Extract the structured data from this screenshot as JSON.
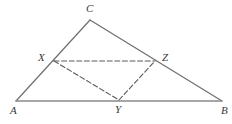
{
  "figure": {
    "type": "geometry-diagram",
    "background_color": "#ffffff",
    "width": 232,
    "height": 124
  },
  "style": {
    "solid_stroke_color": "#6e6e6e",
    "base_stroke_color": "#8a8a8a",
    "dashed_stroke_color": "#5a5a5a",
    "label_color": "#3a3a3a",
    "solid_stroke_width": "1.2",
    "base_stroke_width": "1.4",
    "dashed_stroke_width": "1.1",
    "dash_pattern": "5,2.6"
  },
  "points": {
    "A": {
      "label": "A",
      "x": 16,
      "y": 101,
      "label_x": 10,
      "label_y": 105
    },
    "B": {
      "label": "B",
      "x": 222,
      "y": 101,
      "label_x": 221,
      "label_y": 105
    },
    "C": {
      "label": "C",
      "x": 90,
      "y": 20,
      "label_x": 86,
      "label_y": 3
    },
    "X": {
      "label": "X",
      "x": 54,
      "y": 61,
      "label_x": 38,
      "label_y": 52
    },
    "Y": {
      "label": "Y",
      "x": 119,
      "y": 100,
      "label_x": 115,
      "label_y": 104
    },
    "Z": {
      "label": "Z",
      "x": 155,
      "y": 61,
      "label_x": 162,
      "label_y": 52
    }
  },
  "segments": {
    "solid": [
      {
        "name": "side-AC",
        "from": "A",
        "to": "C",
        "x1": 16,
        "y1": 101,
        "x2": 90,
        "y2": 20
      },
      {
        "name": "side-CB",
        "from": "C",
        "to": "B",
        "x1": 90,
        "y1": 20,
        "x2": 222,
        "y2": 101
      },
      {
        "name": "side-AB",
        "from": "A",
        "to": "B",
        "x1": 16,
        "y1": 101,
        "x2": 222,
        "y2": 101
      }
    ],
    "dashed": [
      {
        "name": "segment-XZ",
        "from": "X",
        "to": "Z",
        "x1": 54,
        "y1": 61,
        "x2": 155,
        "y2": 61
      },
      {
        "name": "segment-XY",
        "from": "X",
        "to": "Y",
        "x1": 54,
        "y1": 61,
        "x2": 119,
        "y2": 100
      },
      {
        "name": "segment-YZ",
        "from": "Y",
        "to": "Z",
        "x1": 119,
        "y1": 100,
        "x2": 155,
        "y2": 61
      }
    ]
  }
}
